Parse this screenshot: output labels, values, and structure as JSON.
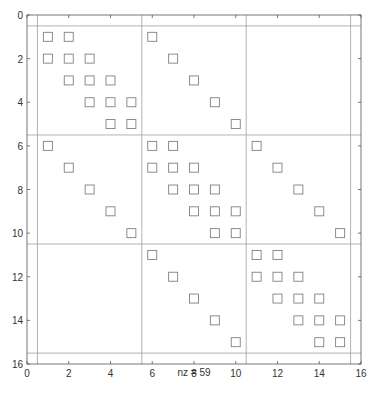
{
  "chart_data": {
    "type": "scatter",
    "subtype": "spy",
    "title": "",
    "xlabel": "nz = 59",
    "ylabel": "",
    "xlim": [
      0,
      16
    ],
    "ylim": [
      16,
      0
    ],
    "y_reversed": true,
    "xticks": [
      0,
      2,
      4,
      6,
      8,
      10,
      12,
      14,
      16
    ],
    "yticks": [
      0,
      2,
      4,
      6,
      8,
      10,
      12,
      14,
      16
    ],
    "xtick_labels": [
      "0",
      "2",
      "4",
      "6",
      "8",
      "10",
      "12",
      "14",
      "16"
    ],
    "ytick_labels": [
      "0",
      "2",
      "4",
      "6",
      "8",
      "10",
      "12",
      "14",
      "16"
    ],
    "marker": "square",
    "marker_color": "#808080",
    "grid_lines_x": [
      0.5,
      5.5,
      10.5,
      15.5
    ],
    "grid_lines_y": [
      0.5,
      5.5,
      10.5,
      15.5
    ],
    "grid_color": "#a0a0a0",
    "nz": 59,
    "points": [
      [
        1,
        1
      ],
      [
        1,
        2
      ],
      [
        1,
        6
      ],
      [
        2,
        1
      ],
      [
        2,
        2
      ],
      [
        2,
        3
      ],
      [
        2,
        7
      ],
      [
        3,
        2
      ],
      [
        3,
        3
      ],
      [
        3,
        4
      ],
      [
        3,
        8
      ],
      [
        4,
        3
      ],
      [
        4,
        4
      ],
      [
        4,
        5
      ],
      [
        4,
        9
      ],
      [
        5,
        4
      ],
      [
        5,
        5
      ],
      [
        5,
        10
      ],
      [
        6,
        1
      ],
      [
        6,
        6
      ],
      [
        6,
        7
      ],
      [
        6,
        11
      ],
      [
        7,
        2
      ],
      [
        7,
        6
      ],
      [
        7,
        7
      ],
      [
        7,
        8
      ],
      [
        7,
        12
      ],
      [
        8,
        3
      ],
      [
        8,
        7
      ],
      [
        8,
        8
      ],
      [
        8,
        9
      ],
      [
        8,
        13
      ],
      [
        9,
        4
      ],
      [
        9,
        8
      ],
      [
        9,
        9
      ],
      [
        9,
        10
      ],
      [
        9,
        14
      ],
      [
        10,
        5
      ],
      [
        10,
        9
      ],
      [
        10,
        10
      ],
      [
        10,
        15
      ],
      [
        11,
        6
      ],
      [
        11,
        11
      ],
      [
        11,
        12
      ],
      [
        12,
        7
      ],
      [
        12,
        11
      ],
      [
        12,
        12
      ],
      [
        12,
        13
      ],
      [
        13,
        8
      ],
      [
        13,
        12
      ],
      [
        13,
        13
      ],
      [
        13,
        14
      ],
      [
        14,
        9
      ],
      [
        14,
        13
      ],
      [
        14,
        14
      ],
      [
        14,
        15
      ],
      [
        15,
        10
      ],
      [
        15,
        14
      ],
      [
        15,
        15
      ]
    ],
    "points_format": "[row, col]"
  }
}
